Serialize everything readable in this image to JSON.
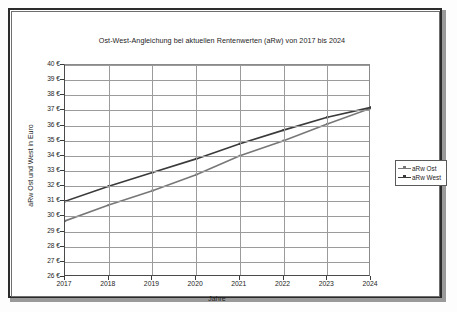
{
  "chart_data": {
    "type": "line",
    "title": "Ost-West-Angleichung bei aktuellen Rentenwerten (aRw)  von 2017 bis 2024",
    "xlabel": "Jahre",
    "ylabel": "aRw Ost und West in Euro",
    "categories": [
      "2017",
      "2018",
      "2019",
      "2020",
      "2021",
      "2022",
      "2023",
      "2024"
    ],
    "x": [
      2017,
      2018,
      2019,
      2020,
      2021,
      2022,
      2023,
      2024
    ],
    "xlim": [
      2017,
      2024
    ],
    "ylim": [
      26,
      40
    ],
    "ytick_step": 1,
    "grid": "horizontal-and-vertical",
    "legend_position": "right",
    "series": [
      {
        "name": "aRw Ost",
        "color": "#777777",
        "values": [
          29.7,
          30.75,
          31.7,
          32.75,
          34.0,
          35.0,
          36.1,
          37.15
        ]
      },
      {
        "name": "aRw West",
        "color": "#3a3a3a",
        "values": [
          31.0,
          32.0,
          32.9,
          33.8,
          34.8,
          35.7,
          36.55,
          37.2
        ]
      }
    ],
    "ytick_labels": [
      "40 €",
      "39 €",
      "38 €",
      "37 €",
      "36 €",
      "35 €",
      "34 €",
      "33 €",
      "32 €",
      "31 €",
      "30 €",
      "29 €",
      "28 €",
      "27 €",
      "26 €"
    ],
    "ytick_values": [
      40,
      39,
      38,
      37,
      36,
      35,
      34,
      33,
      32,
      31,
      30,
      29,
      28,
      27,
      26
    ]
  },
  "legend": {
    "items": [
      {
        "label": "aRw Ost",
        "color": "#777777"
      },
      {
        "label": "aRw West",
        "color": "#3a3a3a"
      }
    ]
  },
  "colors": {
    "series_ost": "#777777",
    "series_west": "#3a3a3a",
    "grid": "#9b9b9b",
    "axis": "#4a4a4a",
    "frame": "#2b2b2b",
    "text": "#1d1d1d",
    "background": "#ffffff"
  }
}
